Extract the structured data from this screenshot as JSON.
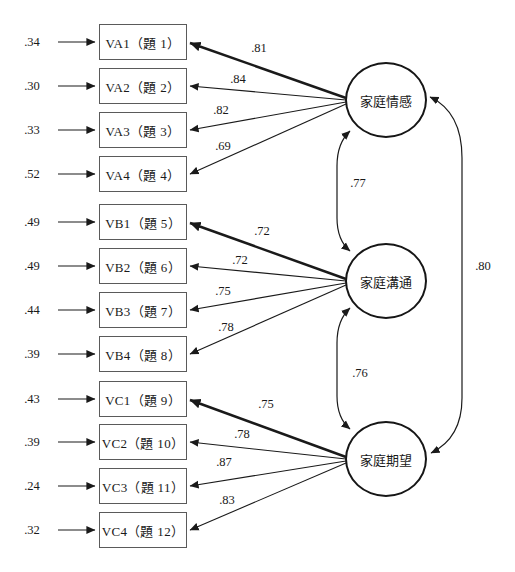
{
  "diagram_type": "confirmatory-factor-analysis-path-diagram",
  "latents": [
    {
      "label": "家庭情感"
    },
    {
      "label": "家庭溝通"
    },
    {
      "label": "家庭期望"
    }
  ],
  "indicators": [
    {
      "label": "VA1（題 1）",
      "error": ".34",
      "loading": ".81",
      "factor": "家庭情感"
    },
    {
      "label": "VA2（題 2）",
      "error": ".30",
      "loading": ".84",
      "factor": "家庭情感"
    },
    {
      "label": "VA3（題 3）",
      "error": ".33",
      "loading": ".82",
      "factor": "家庭情感"
    },
    {
      "label": "VA4（題 4）",
      "error": ".52",
      "loading": ".69",
      "factor": "家庭情感"
    },
    {
      "label": "VB1（題 5）",
      "error": ".49",
      "loading": ".72",
      "factor": "家庭溝通"
    },
    {
      "label": "VB2（題 6）",
      "error": ".49",
      "loading": ".72",
      "factor": "家庭溝通"
    },
    {
      "label": "VB3（題 7）",
      "error": ".44",
      "loading": ".75",
      "factor": "家庭溝通"
    },
    {
      "label": "VB4（題 8）",
      "error": ".39",
      "loading": ".78",
      "factor": "家庭溝通"
    },
    {
      "label": "VC1（題 9）",
      "error": ".43",
      "loading": ".75",
      "factor": "家庭期望"
    },
    {
      "label": "VC2（題 10）",
      "error": ".39",
      "loading": ".78",
      "factor": "家庭期望"
    },
    {
      "label": "VC3（題 11）",
      "error": ".24",
      "loading": ".87",
      "factor": "家庭期望"
    },
    {
      "label": "VC4（題 12）",
      "error": ".32",
      "loading": ".83",
      "factor": "家庭期望"
    }
  ],
  "correlations": [
    {
      "between": "家庭情感 ↔ 家庭溝通",
      "value": ".77"
    },
    {
      "between": "家庭溝通 ↔ 家庭期望",
      "value": ".76"
    },
    {
      "between": "家庭情感 ↔ 家庭期望",
      "value": ".80"
    }
  ],
  "colors": {
    "line": "#1a1a1a",
    "box_border": "#5a5a5a",
    "background": "#ffffff"
  }
}
